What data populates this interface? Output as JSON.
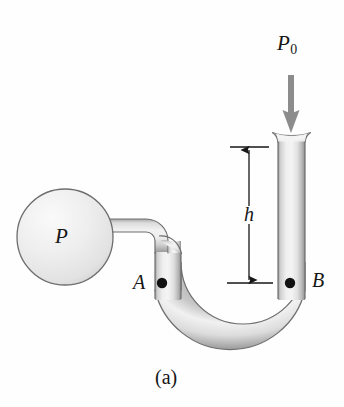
{
  "figure": {
    "caption": "(a)",
    "background_color": "#fefefe",
    "ink_color": "#161616",
    "tube_outline_color": "#6e6e6e",
    "tube_fill_light": "#f2f2f2",
    "tube_fill_mid": "#d8d8d8",
    "tube_fill_dark": "#9a9a9a",
    "arrow_color": "#8c8c8c"
  },
  "labels": {
    "bulb_pressure": "P",
    "atmospheric_pressure": "P",
    "atmospheric_pressure_subscript": "0",
    "height": "h",
    "point_a": "A",
    "point_b": "B"
  },
  "annotations": {
    "dimension_name": "h",
    "dimension_top_y": 147,
    "dimension_bottom_y": 283,
    "dimension_x": 249,
    "point_a_x": 162,
    "point_a_y": 283,
    "point_b_x": 290,
    "point_b_y": 283,
    "downward_arrow_label": "P0",
    "downward_arrow_x": 291,
    "downward_arrow_top_y": 75,
    "downward_arrow_tip_y": 133
  },
  "geometry": {
    "bulb_center_x": 65,
    "bulb_center_y": 237,
    "bulb_radius": 48,
    "left_arm_left_x": 155,
    "left_arm_right_x": 181,
    "right_arm_left_x": 278,
    "right_arm_right_x": 305,
    "right_arm_top_y": 133,
    "u_bend_center_x": 230,
    "u_bend_center_y": 297
  }
}
